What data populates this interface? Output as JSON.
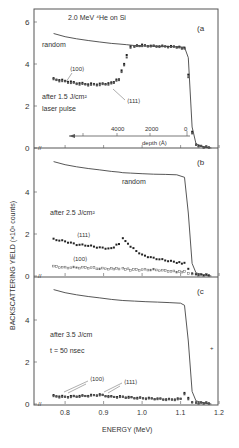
{
  "figure": {
    "ylabel": "BACKSCATTERING YIELD (×10³ counts)",
    "xlabel": "ENERGY (MeV)",
    "xticks": [
      "0.8",
      "0.9",
      "1.0",
      "1.1",
      "1.2"
    ],
    "panels": [
      {
        "id": "a",
        "tag": "(a",
        "title": "2.0 MeV ⁴He on Si",
        "yticks": [
          "0",
          "2",
          "4",
          "6"
        ],
        "labels": {
          "random": "random",
          "c100": "⟨100⟩",
          "c111": "⟨111⟩",
          "cond1": "after 1.5 J/cm²",
          "cond2": "laser pulse"
        },
        "depth_axis": {
          "label": "depth (Å)",
          "ticks": [
            "4000",
            "2000",
            "0"
          ]
        }
      },
      {
        "id": "b",
        "tag": "(b",
        "yticks": [
          "0",
          "2",
          "4"
        ],
        "labels": {
          "random": "random",
          "c111": "⟨111⟩",
          "c100": "⟨100⟩",
          "cond1": "after 2.5 J/cm²"
        }
      },
      {
        "id": "c",
        "tag": "(c",
        "yticks": [
          "0",
          "2",
          "4"
        ],
        "labels": {
          "c100": "⟨100⟩",
          "c111": "⟨111⟩",
          "cond1": "after 3.5 J/cm",
          "cond2": "t = 50 nsec"
        }
      }
    ]
  },
  "chart_data": [
    {
      "type": "line",
      "title": "(a) 2.0 MeV 4He on Si — after 1.5 J/cm² laser pulse",
      "xlabel": "ENERGY (MeV)",
      "ylabel": "BACKSCATTERING YIELD (x10^3 counts)",
      "xlim": [
        0.74,
        1.2
      ],
      "ylim": [
        0,
        6.5
      ],
      "x": [
        0.77,
        0.8,
        0.83,
        0.86,
        0.89,
        0.92,
        0.94,
        0.96,
        0.97,
        0.98,
        1.0,
        1.03,
        1.06,
        1.09,
        1.11,
        1.12,
        1.13,
        1.14,
        1.16,
        1.18
      ],
      "series": [
        {
          "name": "random",
          "values": [
            5.45,
            5.3,
            5.2,
            5.12,
            5.05,
            4.98,
            4.95,
            4.92,
            4.9,
            4.88,
            4.86,
            4.85,
            4.84,
            4.82,
            4.8,
            4.3,
            1.0,
            0.2,
            0.05,
            0.0
          ]
        },
        {
          "name": "<100>",
          "values": [
            3.3,
            3.2,
            3.1,
            3.05,
            3.05,
            3.1,
            3.3,
            4.4,
            4.85,
            4.85,
            4.9,
            4.85,
            4.85,
            4.82,
            4.75,
            3.5,
            0.8,
            0.15,
            0.05,
            0.05
          ]
        },
        {
          "name": "<111>",
          "values": [
            3.25,
            3.15,
            3.05,
            3.0,
            3.0,
            3.05,
            3.25,
            4.3,
            4.8,
            4.85,
            4.85,
            4.85,
            4.82,
            4.8,
            4.72,
            3.4,
            0.7,
            0.12,
            0.05,
            0.05
          ]
        }
      ],
      "secondary_axis": {
        "label": "depth (Å)",
        "ticks": [
          4000,
          2000,
          0
        ]
      }
    },
    {
      "type": "line",
      "title": "(b) after 2.5 J/cm²",
      "xlim": [
        0.74,
        1.2
      ],
      "ylim": [
        0,
        5.5
      ],
      "x": [
        0.77,
        0.8,
        0.83,
        0.86,
        0.89,
        0.92,
        0.94,
        0.95,
        0.97,
        1.0,
        1.03,
        1.06,
        1.09,
        1.11,
        1.12,
        1.13,
        1.14,
        1.16,
        1.18
      ],
      "series": [
        {
          "name": "random",
          "values": [
            5.45,
            5.3,
            5.2,
            5.12,
            5.05,
            4.98,
            4.95,
            4.92,
            4.9,
            4.87,
            4.85,
            4.84,
            4.82,
            4.7,
            3.0,
            0.6,
            0.15,
            0.05,
            0.0
          ]
        },
        {
          "name": "<111>",
          "values": [
            1.75,
            1.65,
            1.5,
            1.45,
            1.35,
            1.3,
            1.55,
            1.8,
            1.4,
            1.0,
            0.85,
            0.75,
            0.65,
            0.6,
            0.35,
            0.15,
            0.08,
            0.05,
            0.05
          ]
        },
        {
          "name": "<100>",
          "values": [
            0.45,
            0.4,
            0.4,
            0.4,
            0.35,
            0.35,
            0.35,
            0.35,
            0.3,
            0.3,
            0.3,
            0.25,
            0.2,
            0.2,
            0.15,
            0.1,
            0.05,
            0.05,
            0.05
          ]
        }
      ]
    },
    {
      "type": "line",
      "title": "(c) after 3.5 J/cm, t = 50 nsec",
      "xlim": [
        0.74,
        1.2
      ],
      "ylim": [
        0,
        5.5
      ],
      "x": [
        0.77,
        0.8,
        0.83,
        0.86,
        0.89,
        0.92,
        0.95,
        0.98,
        1.01,
        1.04,
        1.07,
        1.1,
        1.11,
        1.12,
        1.13,
        1.14,
        1.16,
        1.18
      ],
      "series": [
        {
          "name": "random",
          "values": [
            5.45,
            5.3,
            5.2,
            5.12,
            5.05,
            4.98,
            4.93,
            4.9,
            4.87,
            4.85,
            4.83,
            4.8,
            4.7,
            3.0,
            0.6,
            0.15,
            0.05,
            0.0
          ]
        },
        {
          "name": "<100>",
          "values": [
            0.4,
            0.35,
            0.38,
            0.4,
            0.45,
            0.35,
            0.35,
            0.3,
            0.28,
            0.25,
            0.22,
            0.25,
            0.5,
            0.3,
            0.1,
            0.05,
            0.05,
            0.05
          ]
        },
        {
          "name": "<111>",
          "values": [
            0.35,
            0.32,
            0.35,
            0.38,
            0.42,
            0.33,
            0.32,
            0.28,
            0.26,
            0.24,
            0.2,
            0.22,
            0.45,
            0.25,
            0.1,
            0.05,
            0.05,
            0.05
          ]
        }
      ]
    }
  ]
}
